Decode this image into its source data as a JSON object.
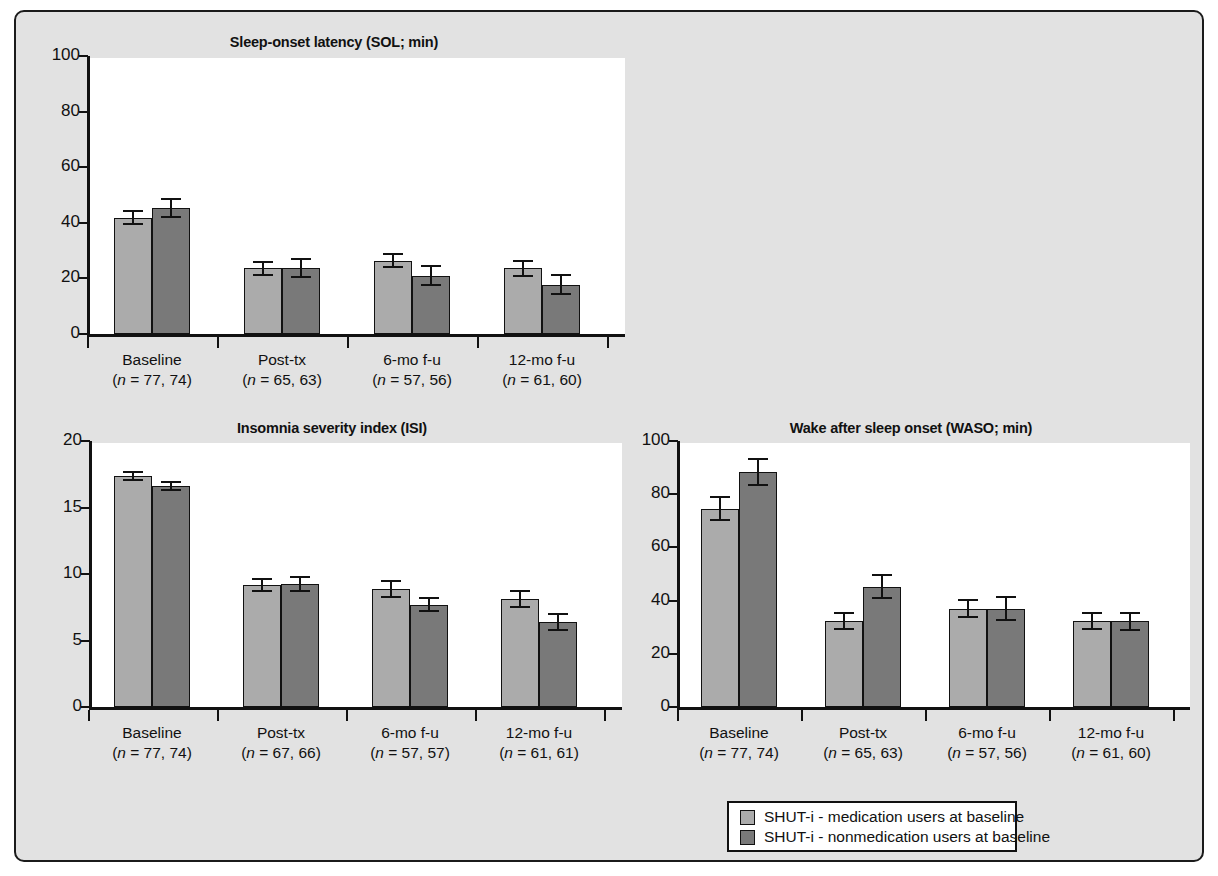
{
  "figure": {
    "background_color": "#e2e2e2",
    "border_color": "#1b1b1b"
  },
  "legend": {
    "items": [
      {
        "label": "SHUT-i - medication users at baseline",
        "color": "#ababab",
        "swatch": "light-gray-square"
      },
      {
        "label": "SHUT-i - nonmedication users at baseline",
        "color": "#797979",
        "swatch": "dark-gray-square"
      }
    ]
  },
  "chart_data": [
    {
      "type": "bar",
      "title": "Sleep-onset latency (SOL; min)",
      "xlabel": "",
      "ylabel": "",
      "ylim": [
        0,
        100
      ],
      "yticks": [
        0,
        20,
        40,
        60,
        80,
        100
      ],
      "ytick_labels": [
        "0",
        "20",
        "40",
        "60",
        "80",
        "100"
      ],
      "grid": false,
      "legend_position": "below-figure",
      "categories": [
        "Baseline",
        "Post-tx",
        "6-mo f-u",
        "12-mo f-u"
      ],
      "category_n": [
        "(n = 77, 74)",
        "(n = 65, 63)",
        "(n = 57, 56)",
        "(n = 61, 60)"
      ],
      "series": [
        {
          "name": "SHUT-i - medication users at baseline",
          "color": "#ababab",
          "values": [
            41.8,
            23.6,
            26.4,
            23.6
          ],
          "errors": [
            2.4,
            2.4,
            2.4,
            2.6
          ]
        },
        {
          "name": "SHUT-i - nonmedication users at baseline",
          "color": "#797979",
          "values": [
            45.3,
            23.6,
            21.0,
            17.8
          ],
          "errors": [
            3.1,
            3.2,
            3.4,
            3.3
          ]
        }
      ]
    },
    {
      "type": "bar",
      "title": "Insomnia severity index (ISI)",
      "xlabel": "",
      "ylabel": "",
      "ylim": [
        0,
        20
      ],
      "yticks": [
        0,
        5,
        10,
        15,
        20
      ],
      "ytick_labels": [
        "0",
        "5",
        "10",
        "15",
        "20"
      ],
      "grid": false,
      "legend_position": "below-figure",
      "categories": [
        "Baseline",
        "Post-tx",
        "6-mo f-u",
        "12-mo f-u"
      ],
      "category_n": [
        "(n = 77, 74)",
        "(n = 67, 66)",
        "(n = 57, 57)",
        "(n = 61, 61)"
      ],
      "series": [
        {
          "name": "SHUT-i - medication users at baseline",
          "color": "#ababab",
          "values": [
            17.35,
            9.2,
            8.85,
            8.1
          ],
          "errors": [
            0.3,
            0.45,
            0.6,
            0.6
          ]
        },
        {
          "name": "SHUT-i - nonmedication users at baseline",
          "color": "#797979",
          "values": [
            16.6,
            9.25,
            7.7,
            6.4
          ],
          "errors": [
            0.3,
            0.5,
            0.5,
            0.6
          ]
        }
      ]
    },
    {
      "type": "bar",
      "title": "Wake after sleep onset (WASO; min)",
      "xlabel": "",
      "ylabel": "",
      "ylim": [
        0,
        100
      ],
      "yticks": [
        0,
        20,
        40,
        60,
        80,
        100
      ],
      "ytick_labels": [
        "0",
        "20",
        "40",
        "60",
        "80",
        "100"
      ],
      "grid": false,
      "legend_position": "below-figure",
      "categories": [
        "Baseline",
        "Post-tx",
        "6-mo f-u",
        "12-mo f-u"
      ],
      "category_n": [
        "(n = 77, 74)",
        "(n = 65, 63)",
        "(n = 57, 56)",
        "(n = 61, 60)"
      ],
      "series": [
        {
          "name": "SHUT-i - medication users at baseline",
          "color": "#ababab",
          "values": [
            74.5,
            32.3,
            37.0,
            32.3
          ],
          "errors": [
            4.3,
            2.9,
            3.3,
            2.9
          ]
        },
        {
          "name": "SHUT-i - nonmedication users at baseline",
          "color": "#797979",
          "values": [
            88.3,
            45.2,
            37.0,
            32.2
          ],
          "errors": [
            5.0,
            4.3,
            4.3,
            3.3
          ]
        }
      ]
    }
  ]
}
